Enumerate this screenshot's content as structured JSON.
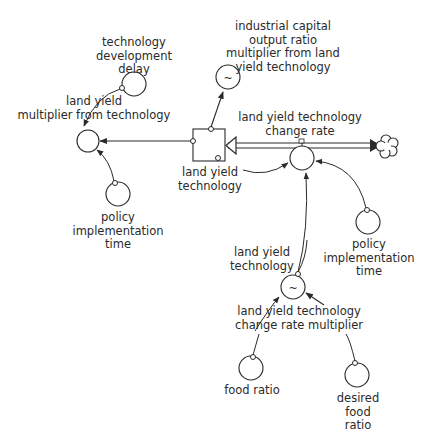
{
  "diagram": {
    "type": "stock-and-flow",
    "stock": {
      "label": "land yield\ntechnology"
    },
    "flow": {
      "label": "land yield technology\nchange rate"
    },
    "converters": {
      "tech_delay": {
        "label": "technology\ndevelopment\ndelay"
      },
      "lymt": {
        "label": "land yield\nmultiplier from technology"
      },
      "icor_mult": {
        "label": "industrial capital\noutput ratio\nmultiplier from land\nyield technology",
        "lookup": "~"
      },
      "pit_left": {
        "label": "policy\nimplementation\ntime"
      },
      "pit_right": {
        "label": "policy\nimplementation\ntime"
      },
      "lytcrm": {
        "label": "land yield technology\nchange rate multiplier",
        "lookup": "~"
      },
      "food_ratio": {
        "label": "food ratio"
      },
      "desired_food_ratio": {
        "label": "desired food\nratio"
      }
    },
    "ghost_labels": {
      "lyt_to_rate": "land yield\ntechnology",
      "lyt_to_mult": "land yield\ntechnology"
    }
  }
}
